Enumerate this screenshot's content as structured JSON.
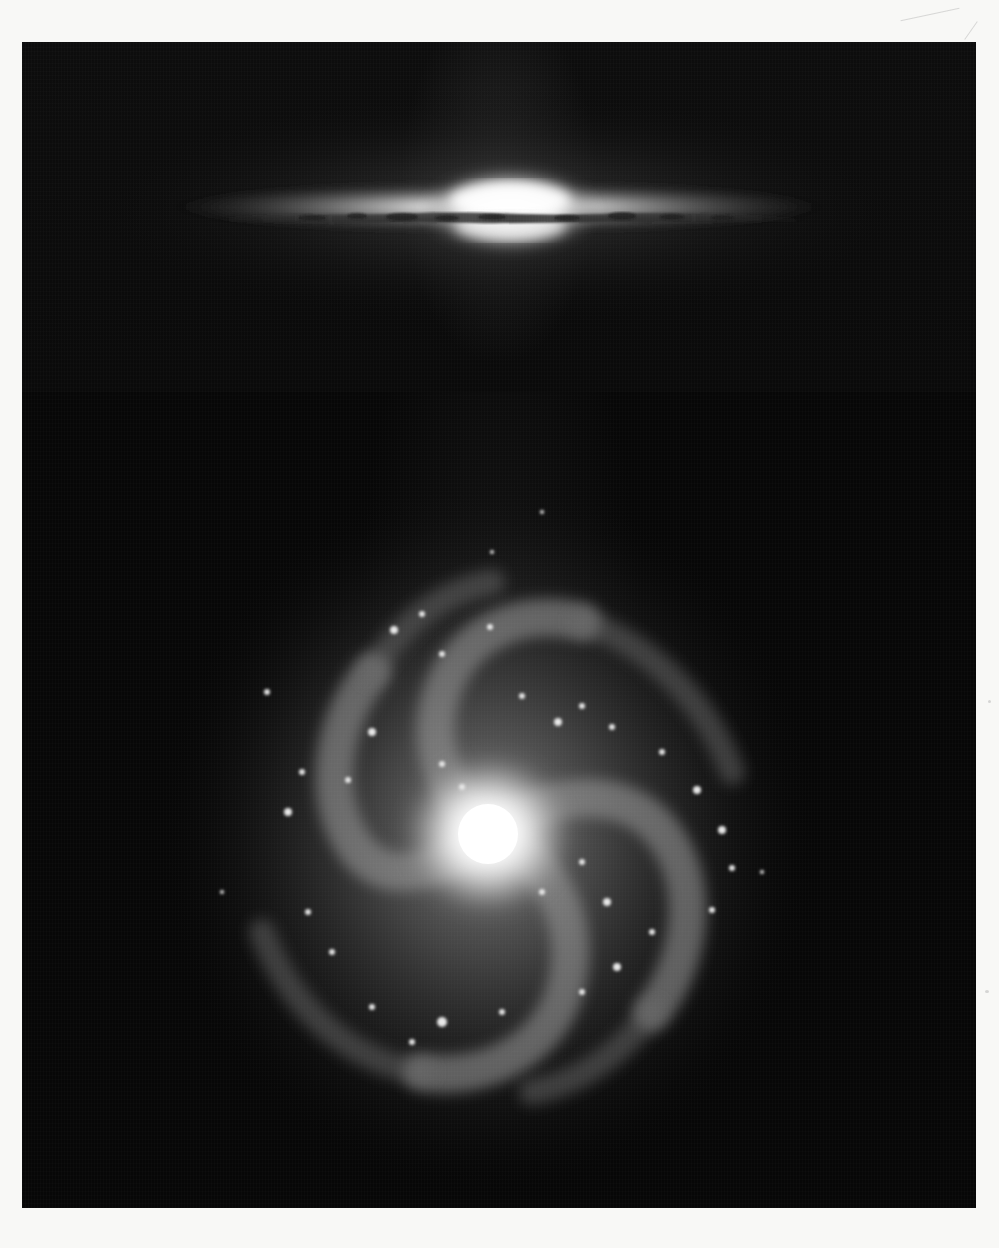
{
  "page": {
    "background_color": "#f8f8f6"
  },
  "photo_panel": {
    "background_color": "#060606",
    "images": [
      {
        "id": "top",
        "subject": "edge-on spiral galaxy",
        "features": [
          "bright central bulge",
          "dark dust lane across disk",
          "thin luminous disk"
        ],
        "orientation": "horizontal"
      },
      {
        "id": "bottom",
        "subject": "face-on spiral galaxy",
        "features": [
          "bright compact nucleus",
          "multiple spiral arms",
          "bright star-forming knots along arms"
        ],
        "orientation": "face-on"
      }
    ]
  },
  "colors": {
    "panel": "#060606",
    "galaxy_core": "#ffffff",
    "galaxy_glow": "#9a9a9a",
    "dust_lane": "#2a2a2a"
  }
}
